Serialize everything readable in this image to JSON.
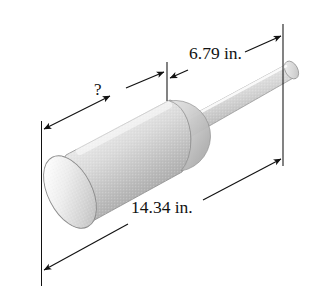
{
  "figure": {
    "background_color": "#ffffff",
    "line_color": "#121212",
    "body_fill_light": "#f2f2f2",
    "body_fill_mid": "#cfcfcf",
    "body_fill_dark": "#9a9a9a",
    "object": {
      "name": "stepped-shaft",
      "parts": [
        {
          "name": "thick-cylinder",
          "description": "large diameter cylinder at lower left with visible elliptical end cap"
        },
        {
          "name": "thin-rod",
          "description": "small diameter rod extending up and to the right"
        }
      ]
    }
  },
  "dimensions": [
    {
      "id": "unknown-length",
      "label": "?",
      "value": null,
      "unit": "in.",
      "arrow_style": "double-headed",
      "measures": "thick-cylinder length",
      "from_extension_line": "left-extension-line",
      "to_extension_line": "middle-extension-line"
    },
    {
      "id": "rod-length",
      "label": "6.79 in.",
      "value": 6.79,
      "unit": "in.",
      "arrow_style": "double-headed",
      "measures": "thin-rod length",
      "from_extension_line": "middle-extension-line",
      "to_extension_line": "right-extension-line"
    },
    {
      "id": "total-length",
      "label": "14.34 in.",
      "value": 14.34,
      "unit": "in.",
      "arrow_style": "double-headed",
      "measures": "overall shaft length",
      "from_extension_line": "left-extension-line",
      "to_extension_line": "right-extension-line"
    }
  ],
  "extension_lines": [
    {
      "id": "left-extension-line",
      "orientation": "vertical"
    },
    {
      "id": "middle-extension-line",
      "orientation": "vertical"
    },
    {
      "id": "right-extension-line",
      "orientation": "vertical"
    }
  ]
}
